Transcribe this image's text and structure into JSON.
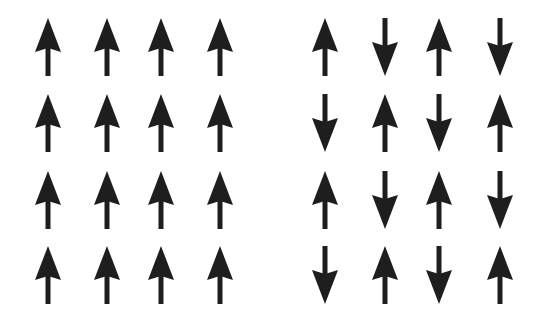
{
  "diagram": {
    "type": "spin-lattice",
    "arrow_color": "#1e1e1e",
    "panels": [
      {
        "name": "ferromagnetic",
        "rows": [
          [
            "up",
            "up",
            "up",
            "up"
          ],
          [
            "up",
            "up",
            "up",
            "up"
          ],
          [
            "up",
            "up",
            "up",
            "up"
          ],
          [
            "up",
            "up",
            "up",
            "up"
          ]
        ]
      },
      {
        "name": "antiferromagnetic",
        "rows": [
          [
            "up",
            "down",
            "up",
            "down"
          ],
          [
            "down",
            "up",
            "down",
            "up"
          ],
          [
            "up",
            "down",
            "up",
            "down"
          ],
          [
            "down",
            "up",
            "down",
            "up"
          ]
        ]
      }
    ]
  }
}
